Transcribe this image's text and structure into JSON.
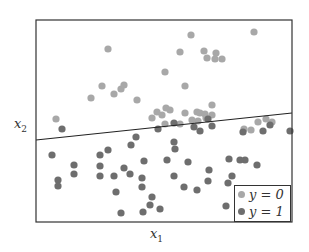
{
  "chart_data": {
    "type": "scatter",
    "title": "",
    "xlabel": "x1",
    "ylabel": "x2",
    "grid": false,
    "ticks": "none",
    "legend_position": "lower right",
    "legend": [
      "y = 0",
      "y = 1"
    ],
    "colors": {
      "y0": "#a8a8a8",
      "y1": "#6e6e6e",
      "line": "#222222",
      "frame": "#333333"
    },
    "frame_px": {
      "left": 36,
      "top": 20,
      "right": 292,
      "bottom": 222
    },
    "decision_boundary_px": {
      "x1": 36,
      "y1": 140,
      "x2": 292,
      "y2": 113
    },
    "series": [
      {
        "name": "y = 0",
        "points_px": [
          [
            108,
            49
          ],
          [
            191,
            35
          ],
          [
            254,
            32
          ],
          [
            180,
            52
          ],
          [
            204,
            51
          ],
          [
            216,
            53
          ],
          [
            207,
            58
          ],
          [
            215,
            59
          ],
          [
            222,
            59
          ],
          [
            91,
            98
          ],
          [
            102,
            86
          ],
          [
            114,
            94
          ],
          [
            121,
            89
          ],
          [
            124,
            85
          ],
          [
            165,
            72
          ],
          [
            170,
            110
          ],
          [
            185,
            86
          ],
          [
            185,
            113
          ],
          [
            56,
            119
          ],
          [
            137,
            100
          ],
          [
            212,
            105
          ],
          [
            166,
            108
          ],
          [
            152,
            118
          ],
          [
            157,
            112
          ],
          [
            197,
            112
          ],
          [
            200,
            113
          ],
          [
            205,
            114
          ],
          [
            198,
            121
          ],
          [
            212,
            115
          ],
          [
            206,
            118
          ],
          [
            162,
            115
          ],
          [
            165,
            124
          ],
          [
            180,
            124
          ],
          [
            192,
            120
          ],
          [
            244,
            129
          ],
          [
            258,
            122
          ],
          [
            266,
            119
          ],
          [
            251,
            130
          ],
          [
            272,
            122
          ]
        ]
      },
      {
        "name": "y = 1",
        "points_px": [
          [
            62,
            129
          ],
          [
            136,
            137
          ],
          [
            131,
            145
          ],
          [
            108,
            150
          ],
          [
            158,
            129
          ],
          [
            174,
            123
          ],
          [
            194,
            127
          ],
          [
            200,
            131
          ],
          [
            174,
            142
          ],
          [
            208,
            119
          ],
          [
            212,
            126
          ],
          [
            263,
            131
          ],
          [
            270,
            125
          ],
          [
            243,
            132
          ],
          [
            290,
            131
          ],
          [
            52,
            155
          ],
          [
            74,
            165
          ],
          [
            58,
            180
          ],
          [
            58,
            186
          ],
          [
            100,
            155
          ],
          [
            100,
            166
          ],
          [
            100,
            176
          ],
          [
            114,
            176
          ],
          [
            124,
            168
          ],
          [
            130,
            174
          ],
          [
            142,
            178
          ],
          [
            144,
            161
          ],
          [
            175,
            149
          ],
          [
            167,
            160
          ],
          [
            174,
            176
          ],
          [
            188,
            162
          ],
          [
            184,
            187
          ],
          [
            197,
            190
          ],
          [
            208,
            181
          ],
          [
            209,
            170
          ],
          [
            232,
            176
          ],
          [
            229,
            159
          ],
          [
            245,
            160
          ],
          [
            142,
            187
          ],
          [
            152,
            197
          ],
          [
            150,
            205
          ],
          [
            143,
            212
          ],
          [
            160,
            209
          ],
          [
            116,
            192
          ],
          [
            121,
            213
          ],
          [
            74,
            174
          ],
          [
            228,
            183
          ],
          [
            226,
            206
          ],
          [
            240,
            160
          ],
          [
            257,
            165
          ]
        ]
      }
    ]
  },
  "axes": {
    "xlabel_var": "x",
    "xlabel_sub": "1",
    "ylabel_var": "x",
    "ylabel_sub": "2"
  },
  "legend": {
    "items": [
      {
        "label": "y = 0",
        "color": "#a8a8a8"
      },
      {
        "label": "y = 1",
        "color": "#6e6e6e"
      }
    ]
  }
}
